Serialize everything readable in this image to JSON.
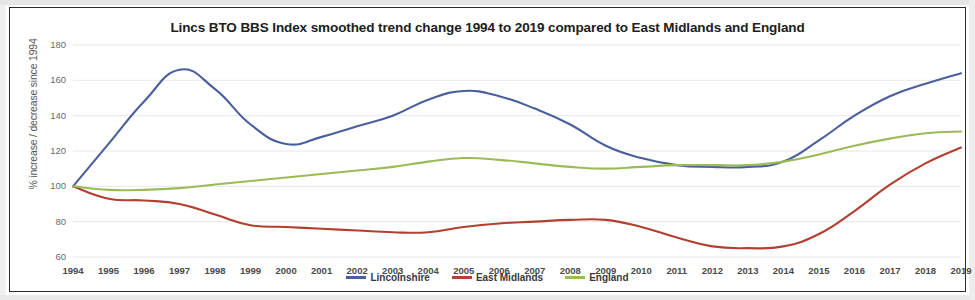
{
  "chart_data": {
    "type": "line",
    "title": "Lincs BTO BBS Index smoothed trend change 1994 to 2019 compared to East Midlands and England",
    "xlabel": "",
    "ylabel": "% increase / decrease since 1994",
    "ylim": [
      60,
      180
    ],
    "yticks": [
      60,
      80,
      100,
      120,
      140,
      160,
      180
    ],
    "grid": true,
    "legend_position": "bottom",
    "categories": [
      "1994",
      "1995",
      "1996",
      "1997",
      "1998",
      "1999",
      "2000",
      "2001",
      "2002",
      "2003",
      "2004",
      "2005",
      "2006",
      "2007",
      "2008",
      "2009",
      "2010",
      "2011",
      "2012",
      "2013",
      "2014",
      "2015",
      "2016",
      "2017",
      "2018",
      "2019"
    ],
    "series": [
      {
        "name": "Lincolnshire",
        "color": "#4a5f9e",
        "values": [
          100,
          124,
          148,
          166,
          155,
          135,
          124,
          128,
          134,
          140,
          149,
          154,
          151,
          144,
          135,
          123,
          116,
          112,
          111,
          111,
          114,
          126,
          140,
          151,
          158,
          164
        ]
      },
      {
        "name": "East Midlands",
        "color": "#b04030",
        "values": [
          100,
          93,
          92,
          90,
          84,
          78,
          77,
          76,
          75,
          74,
          74,
          77,
          79,
          80,
          81,
          81,
          77,
          71,
          66,
          65,
          66,
          73,
          86,
          101,
          113,
          122
        ]
      },
      {
        "name": "England",
        "color": "#9bbb59",
        "values": [
          100,
          98,
          98,
          99,
          101,
          103,
          105,
          107,
          109,
          111,
          114,
          116,
          115,
          113,
          111,
          110,
          111,
          112,
          112,
          112,
          114,
          118,
          123,
          127,
          130,
          131
        ]
      }
    ]
  },
  "legend": {
    "items": [
      {
        "label": "Lincolnshire",
        "color": "#4a5f9e"
      },
      {
        "label": "East Midlands",
        "color": "#b04030"
      },
      {
        "label": "England",
        "color": "#9bbb59"
      }
    ]
  }
}
